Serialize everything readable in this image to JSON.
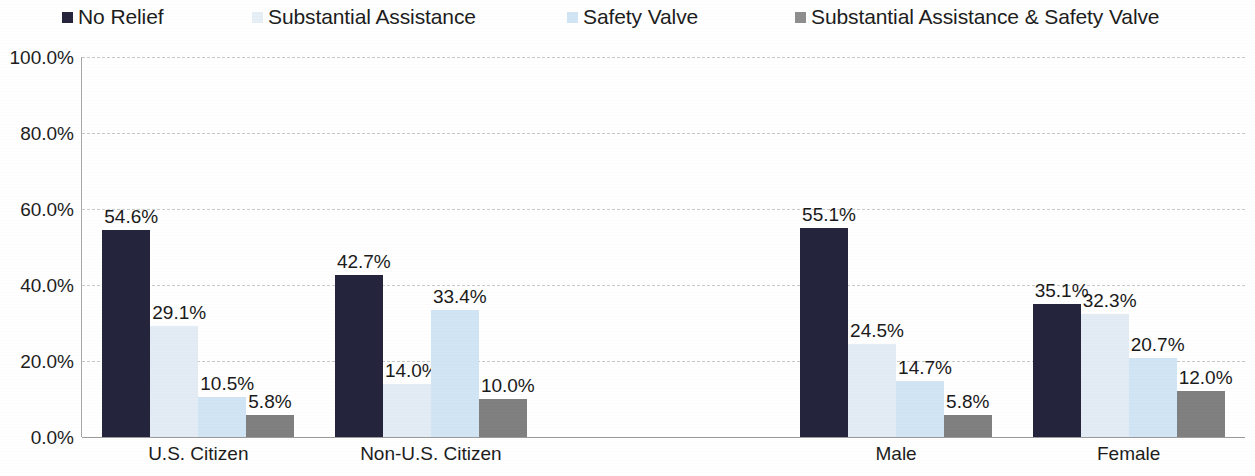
{
  "chart_data": {
    "type": "bar",
    "title": "",
    "subtitle": "",
    "xlabel": "",
    "ylabel": "",
    "ylim": [
      0,
      100
    ],
    "ytick_labels": [
      "100.0%",
      "80.0%",
      "60.0%",
      "40.0%",
      "20.0%",
      "0.0%"
    ],
    "ytick_values": [
      100,
      80,
      60,
      40,
      20,
      0
    ],
    "grid": true,
    "legend_position": "top",
    "value_label_suffix": "%",
    "categories": [
      "U.S. Citizen",
      "Non-U.S. Citizen",
      "",
      "Male",
      "Female"
    ],
    "series": [
      {
        "name": "No Relief",
        "color": "#24243c",
        "values": [
          54.6,
          29.1,
          null,
          55.1,
          35.1
        ],
        "values_by_category": {
          "U.S. Citizen": 54.6,
          "Non-U.S. Citizen": 42.7,
          "Male": 55.1,
          "Female": 35.1
        }
      },
      {
        "name": "Substantial Assistance",
        "color": "#e3ecf4",
        "values": [
          29.1,
          14.0,
          null,
          24.5,
          32.3
        ]
      },
      {
        "name": "Safety Valve",
        "color": "#d2e5f4",
        "values": [
          10.5,
          33.4,
          null,
          14.7,
          20.7
        ]
      },
      {
        "name": "Substantial Assistance & Safety Valve",
        "color": "#808080",
        "values": [
          5.8,
          10.0,
          null,
          5.8,
          12.0
        ]
      }
    ],
    "groups": [
      {
        "category": "U.S. Citizen",
        "bars": [
          {
            "series": "No Relief",
            "value": 54.6,
            "label": "54.6%"
          },
          {
            "series": "Substantial Assistance",
            "value": 29.1,
            "label": "29.1%"
          },
          {
            "series": "Safety Valve",
            "value": 10.5,
            "label": "10.5%"
          },
          {
            "series": "Substantial Assistance & Safety Valve",
            "value": 5.8,
            "label": "5.8%"
          }
        ]
      },
      {
        "category": "Non-U.S. Citizen",
        "bars": [
          {
            "series": "No Relief",
            "value": 42.7,
            "label": "42.7%"
          },
          {
            "series": "Substantial Assistance",
            "value": 14.0,
            "label": "14.0%"
          },
          {
            "series": "Safety Valve",
            "value": 33.4,
            "label": "33.4%"
          },
          {
            "series": "Substantial Assistance & Safety Valve",
            "value": 10.0,
            "label": "10.0%"
          }
        ]
      },
      {
        "category": "",
        "bars": []
      },
      {
        "category": "Male",
        "bars": [
          {
            "series": "No Relief",
            "value": 55.1,
            "label": "55.1%"
          },
          {
            "series": "Substantial Assistance",
            "value": 24.5,
            "label": "24.5%"
          },
          {
            "series": "Safety Valve",
            "value": 14.7,
            "label": "14.7%"
          },
          {
            "series": "Substantial Assistance & Safety Valve",
            "value": 5.8,
            "label": "5.8%"
          }
        ]
      },
      {
        "category": "Female",
        "bars": [
          {
            "series": "No Relief",
            "value": 35.1,
            "label": "35.1%"
          },
          {
            "series": "Substantial Assistance",
            "value": 32.3,
            "label": "32.3%"
          },
          {
            "series": "Safety Valve",
            "value": 20.7,
            "label": "20.7%"
          },
          {
            "series": "Substantial Assistance & Safety Valve",
            "value": 12.0,
            "label": "12.0%"
          }
        ]
      }
    ]
  },
  "legend": {
    "items": [
      {
        "label": "No Relief",
        "color": "#24243c",
        "x": 62
      },
      {
        "label": "Substantial Assistance",
        "color": "#e6eef6",
        "x": 252
      },
      {
        "label": "Safety Valve",
        "color": "#d2e5f4",
        "x": 567
      },
      {
        "label": "Substantial Assistance & Safety Valve",
        "color": "#8e8e8e",
        "x": 795
      }
    ]
  }
}
